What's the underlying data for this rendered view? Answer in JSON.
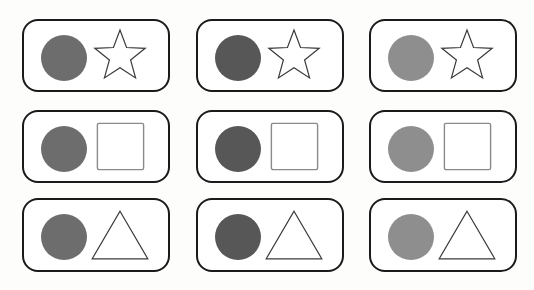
{
  "canvas": {
    "width": 534,
    "height": 290,
    "background_color": "#fdfdfb",
    "description": "Three-by-three grid of rounded rectangle cards, each holding a filled gray circle beside an outlined geometric shape"
  },
  "style": {
    "card_fill": "#ffffff",
    "card_border_color": "#1a1a1a",
    "card_border_width": 2.5,
    "card_corner_radius": 16,
    "outline_stroke_color": "#3a3a3a",
    "square_stroke_color": "#8a8a8a",
    "outline_stroke_width": 1.2
  },
  "layout": {
    "columns": [
      {
        "index": 1,
        "x": 22,
        "width": 148
      },
      {
        "index": 2,
        "x": 196,
        "width": 148
      },
      {
        "index": 3,
        "x": 369,
        "width": 148
      }
    ],
    "rows": [
      {
        "index": 1,
        "y": 19,
        "height": 73,
        "shape": "star"
      },
      {
        "index": 2,
        "y": 110,
        "height": 73,
        "shape": "square"
      },
      {
        "index": 3,
        "y": 198,
        "height": 74,
        "shape": "triangle"
      }
    ]
  },
  "circle_shades": {
    "column_1": "#6d6d6d",
    "column_2": "#575757",
    "column_3": "#8e8e8e"
  },
  "cards": [
    {
      "id": "card-r1c1",
      "row": 1,
      "column": 1,
      "circle": {
        "name": "gray-circle",
        "fill": "#6d6d6d",
        "radius": 23,
        "cx": 40,
        "cy": 37
      },
      "shape": {
        "name": "star-outline",
        "type": "star",
        "points": 5,
        "filled": false
      }
    },
    {
      "id": "card-r1c2",
      "row": 1,
      "column": 2,
      "circle": {
        "name": "gray-circle",
        "fill": "#575757",
        "radius": 23,
        "cx": 40,
        "cy": 37
      },
      "shape": {
        "name": "star-outline",
        "type": "star",
        "points": 5,
        "filled": false
      }
    },
    {
      "id": "card-r1c3",
      "row": 1,
      "column": 3,
      "circle": {
        "name": "gray-circle",
        "fill": "#8e8e8e",
        "radius": 23,
        "cx": 40,
        "cy": 37
      },
      "shape": {
        "name": "star-outline",
        "type": "star",
        "points": 5,
        "filled": false
      }
    },
    {
      "id": "card-r2c1",
      "row": 2,
      "column": 1,
      "circle": {
        "name": "gray-circle",
        "fill": "#6d6d6d",
        "radius": 23,
        "cx": 40,
        "cy": 37
      },
      "shape": {
        "name": "square-outline",
        "type": "square",
        "filled": false
      }
    },
    {
      "id": "card-r2c2",
      "row": 2,
      "column": 2,
      "circle": {
        "name": "gray-circle",
        "fill": "#575757",
        "radius": 23,
        "cx": 40,
        "cy": 37
      },
      "shape": {
        "name": "square-outline",
        "type": "square",
        "filled": false
      }
    },
    {
      "id": "card-r2c3",
      "row": 2,
      "column": 3,
      "circle": {
        "name": "gray-circle",
        "fill": "#8e8e8e",
        "radius": 23,
        "cx": 40,
        "cy": 37
      },
      "shape": {
        "name": "square-outline",
        "type": "square",
        "filled": false
      }
    },
    {
      "id": "card-r3c1",
      "row": 3,
      "column": 1,
      "circle": {
        "name": "gray-circle",
        "fill": "#6d6d6d",
        "radius": 23,
        "cx": 40,
        "cy": 37
      },
      "shape": {
        "name": "triangle-outline",
        "type": "triangle",
        "filled": false
      }
    },
    {
      "id": "card-r3c2",
      "row": 3,
      "column": 2,
      "circle": {
        "name": "gray-circle",
        "fill": "#575757",
        "radius": 23,
        "cx": 40,
        "cy": 37
      },
      "shape": {
        "name": "triangle-outline",
        "type": "triangle",
        "filled": false
      }
    },
    {
      "id": "card-r3c3",
      "row": 3,
      "column": 3,
      "circle": {
        "name": "gray-circle",
        "fill": "#8e8e8e",
        "radius": 23,
        "cx": 40,
        "cy": 37
      },
      "shape": {
        "name": "triangle-outline",
        "type": "triangle",
        "filled": false
      }
    }
  ]
}
